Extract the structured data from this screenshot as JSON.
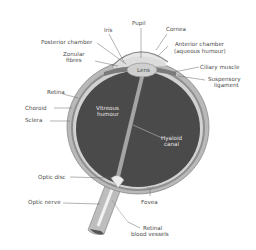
{
  "diagram": {
    "colors": {
      "background": "#ffffff",
      "vitreous": "#4a4a4a",
      "sclera": "#b9b9b9",
      "choroid": "#8f8f8f",
      "retina": "#d2d2d2",
      "lens": "#cfcfcf",
      "label": "#4a4a4a"
    },
    "labels": {
      "pupil": "Pupil",
      "iris": "Iris",
      "cornea": "Cornea",
      "posterior_chamber": "Posterior chamber",
      "zonular_fibres_1": "Zonular",
      "zonular_fibres_2": "fibres",
      "anterior_chamber_1": "Anterior chamber",
      "anterior_chamber_2": "(aqueous humour)",
      "lens": "Lens",
      "ciliary_muscle": "Ciliary muscle",
      "suspensory_ligament_1": "Suspensory",
      "suspensory_ligament_2": "ligament",
      "retina": "Retina",
      "choroid": "Choroid",
      "sclera": "Sclera",
      "vitreous_humour_1": "Vitreous",
      "vitreous_humour_2": "humour",
      "hyaloid_canal_1": "Hyaloid",
      "hyaloid_canal_2": "canal",
      "optic_disc": "Optic disc",
      "optic_nerve": "Optic nerve",
      "fovea": "Fovea",
      "retinal_blood_vessels_1": "Retinal",
      "retinal_blood_vessels_2": "blood vessels"
    }
  }
}
